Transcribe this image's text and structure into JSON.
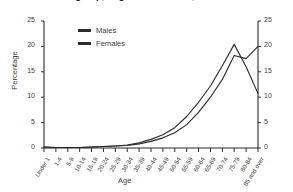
{
  "chart_data": {
    "type": "line",
    "title": "group, England and Wales, 1997",
    "xlabel": "Age",
    "ylabel": "Percentage",
    "ylim": [
      0,
      25
    ],
    "yticks": [
      0,
      5,
      10,
      15,
      20,
      25
    ],
    "grid": false,
    "legend_position": "top-left-inside",
    "right_axis_mirrors_left": true,
    "categories": [
      "Under 1",
      "1-4",
      "5-9",
      "10-14",
      "15-19",
      "20-24",
      "25-29",
      "30-34",
      "35-39",
      "40-44",
      "45-49",
      "50-54",
      "55-59",
      "60-64",
      "65-69",
      "70-74",
      "75-79",
      "80-84",
      "85 and over"
    ],
    "series": [
      {
        "name": "Males",
        "values": [
          0.2,
          0.1,
          0.1,
          0.1,
          0.2,
          0.3,
          0.4,
          0.6,
          1.0,
          1.7,
          2.6,
          4.0,
          6.2,
          9.0,
          12.2,
          16.2,
          20.4,
          16.0,
          10.7
        ]
      },
      {
        "name": "Females",
        "values": [
          0.2,
          0.1,
          0.1,
          0.1,
          0.2,
          0.3,
          0.4,
          0.5,
          0.8,
          1.3,
          2.0,
          3.0,
          4.6,
          7.0,
          10.0,
          13.5,
          18.2,
          17.6,
          20.0
        ]
      }
    ]
  },
  "legend": {
    "items": [
      {
        "label": "Males"
      },
      {
        "label": "Females"
      }
    ]
  }
}
